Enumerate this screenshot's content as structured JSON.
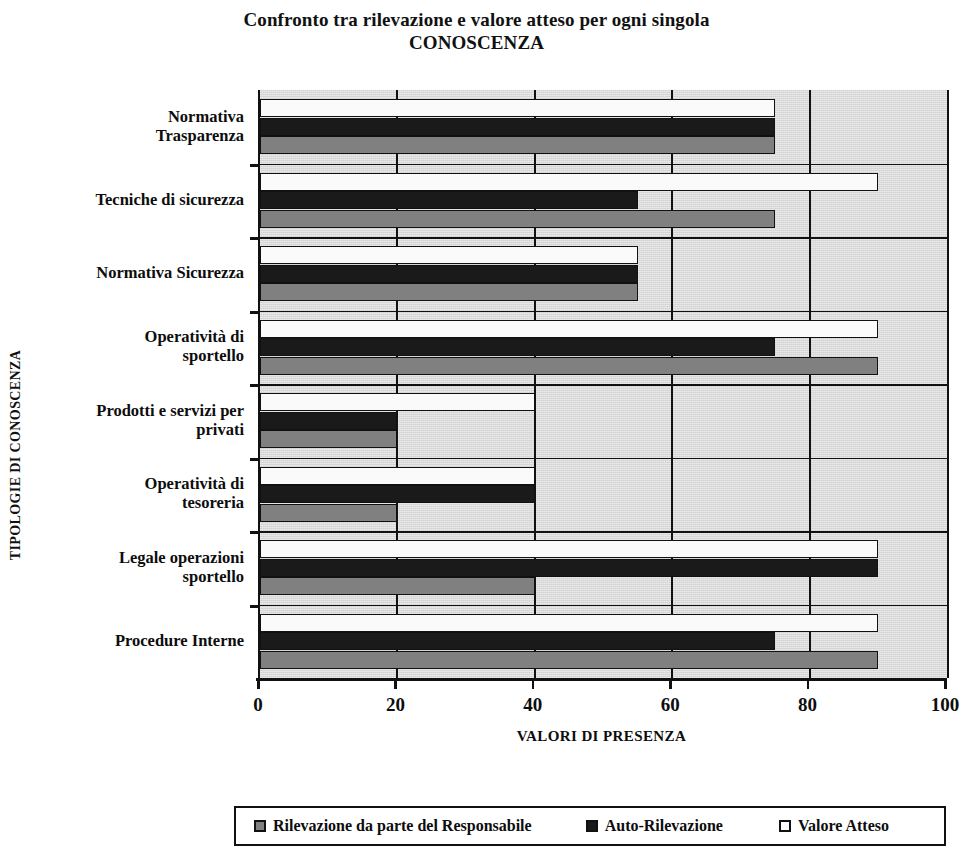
{
  "chart_data": {
    "type": "bar",
    "orientation": "horizontal",
    "title": "Confronto tra rilevazione e valore atteso per ogni singola",
    "title_line2": "CONOSCENZA",
    "xlabel": "VALORI DI PRESENZA",
    "ylabel": "TIPOLOGIE DI CONOSCENZA",
    "xlim": [
      0,
      100
    ],
    "xticks": [
      0,
      20,
      40,
      60,
      80,
      100
    ],
    "xtick_labels": [
      "0",
      "20",
      "40",
      "60",
      "80",
      "100"
    ],
    "grid": true,
    "legend_position": "bottom",
    "categories": [
      "Normativa Trasparenza",
      "Tecniche di sicurezza",
      "Normativa Sicurezza",
      "Operatività di sportello",
      "Prodotti e servizi per privati",
      "Operatività di tesoreria",
      "Legale operazioni sportello",
      "Procedure Interne"
    ],
    "category_lines": [
      [
        "Normativa",
        "Trasparenza"
      ],
      [
        "Tecniche di sicurezza"
      ],
      [
        "Normativa Sicurezza"
      ],
      [
        "Operatività di",
        "sportello"
      ],
      [
        "Prodotti e servizi per",
        "privati"
      ],
      [
        "Operatività di",
        "tesoreria"
      ],
      [
        "Legale operazioni",
        "sportello"
      ],
      [
        "Procedure Interne"
      ]
    ],
    "series": [
      {
        "name": "Rilevazione da parte del Responsabile",
        "color": "#808080",
        "values": [
          75,
          75,
          55,
          90,
          20,
          20,
          40,
          90
        ]
      },
      {
        "name": "Auto-Rilevazione",
        "color": "#1a1a1a",
        "values": [
          75,
          55,
          55,
          75,
          20,
          40,
          90,
          75
        ]
      },
      {
        "name": "Valore Atteso",
        "color": "#ffffff",
        "values": [
          75,
          90,
          55,
          90,
          40,
          40,
          90,
          90
        ]
      }
    ]
  },
  "colors": {
    "plot_background": "#dcdcdc",
    "axis": "#111111",
    "page_background": "#ffffff"
  }
}
